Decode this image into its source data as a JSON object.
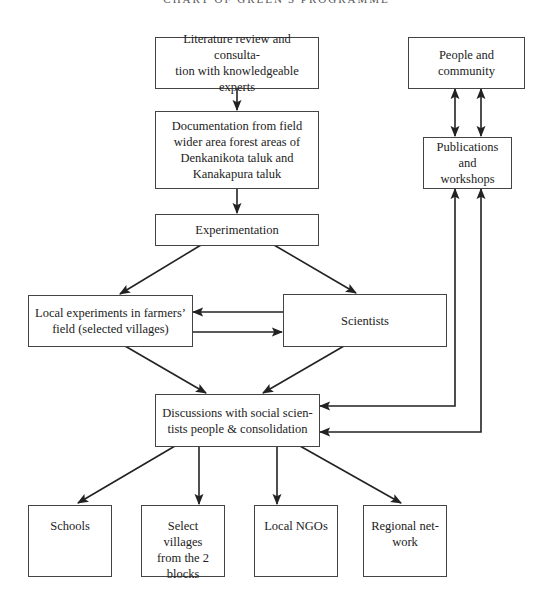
{
  "header": {
    "title": "CHART OF GREEN'S PROGRAMME"
  },
  "nodes": {
    "literature": {
      "label": "Literature review and consulta-tion with knowledgeable experts",
      "line1": "Literature review and consulta-",
      "line2": "tion with knowledgeable experts"
    },
    "documentation": {
      "label": "Documentation from field wider area forest areas of Denkanikota taluk and Kanakapura taluk",
      "line1": "Documentation from field",
      "line2": "wider area forest areas of",
      "line3": "Denkanikota taluk and",
      "line4": "Kanakapura taluk"
    },
    "experimentation": {
      "label": "Experimentation"
    },
    "local_experiments": {
      "label": "Local experiments in farmers' field (selected villages)",
      "line1": "Local experiments in farmers’",
      "line2": "field (selected villages)"
    },
    "scientists": {
      "label": "Scientists"
    },
    "people_community": {
      "label": "People and community"
    },
    "publications": {
      "label": "Publications and workshops",
      "line1": "Publications",
      "line2": "and workshops"
    },
    "discussions": {
      "label": "Discussions with social scien-tists people & consolidation",
      "line1": "Discussions with social scien-",
      "line2": "tists people & consolidation"
    },
    "schools": {
      "label": "Schools"
    },
    "select_villages": {
      "label": "Select villages from the 2 blocks",
      "line1": "Select villages",
      "line2": "from the 2",
      "line3": "blocks"
    },
    "local_ngos": {
      "label": "Local NGOs"
    },
    "regional_network": {
      "label": "Regional net-work",
      "line1": "Regional net-",
      "line2": "work"
    }
  },
  "edges": [
    {
      "from": "literature",
      "to": "documentation"
    },
    {
      "from": "documentation",
      "to": "experimentation"
    },
    {
      "from": "experimentation",
      "to": "local_experiments"
    },
    {
      "from": "experimentation",
      "to": "scientists"
    },
    {
      "from": "scientists",
      "to": "local_experiments"
    },
    {
      "from": "local_experiments",
      "to": "scientists"
    },
    {
      "from": "local_experiments",
      "to": "discussions"
    },
    {
      "from": "scientists",
      "to": "discussions"
    },
    {
      "from": "people_community",
      "to": "publications",
      "bidirectional": true
    },
    {
      "from": "publications",
      "to": "people_community",
      "bidirectional": true
    },
    {
      "from": "discussions",
      "to": "publications",
      "bidirectional": true
    },
    {
      "from": "publications",
      "to": "discussions",
      "bidirectional": true
    },
    {
      "from": "discussions",
      "to": "schools"
    },
    {
      "from": "discussions",
      "to": "select_villages"
    },
    {
      "from": "discussions",
      "to": "local_ngos"
    },
    {
      "from": "discussions",
      "to": "regional_network"
    }
  ],
  "colors": {
    "line": "#222222",
    "border": "#444444",
    "background": "#ffffff"
  }
}
